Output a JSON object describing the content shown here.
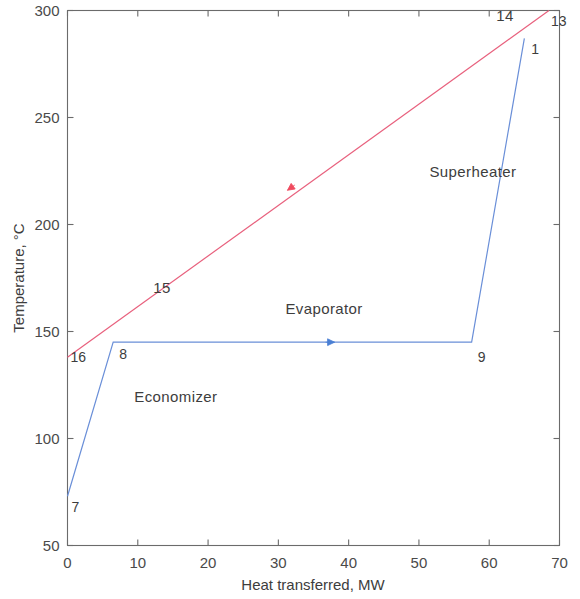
{
  "chart_data": {
    "type": "line",
    "title": "",
    "xlabel": "Heat transferred, MW",
    "ylabel": "Temperature, °C",
    "xlim": [
      0,
      70
    ],
    "ylim": [
      50,
      300
    ],
    "xticks": [
      "0",
      "10",
      "20",
      "30",
      "40",
      "50",
      "60",
      "70"
    ],
    "xtick_values": [
      0,
      10,
      20,
      30,
      40,
      50,
      60,
      70
    ],
    "yticks": [
      "50",
      "100",
      "150",
      "200",
      "250",
      "300"
    ],
    "ytick_values": [
      50,
      100,
      150,
      200,
      250,
      300
    ],
    "grid": false,
    "legend": "none",
    "series": [
      {
        "name": "Water / steam side",
        "color": "#6a8fd8",
        "direction": "left-to-right",
        "x": [
          0,
          6.5,
          57.5,
          65
        ],
        "y": [
          73,
          145,
          145,
          287
        ],
        "point_labels": [
          "7",
          "8",
          "9",
          "1"
        ]
      },
      {
        "name": "Flue gas side",
        "color": "#e8607d",
        "direction": "right-to-left",
        "x": [
          0,
          68.5
        ],
        "y": [
          138,
          300
        ],
        "point_labels": [
          "16",
          "13"
        ]
      }
    ],
    "annotations": [
      {
        "text": "Economizer",
        "x": 9.5,
        "y": 117
      },
      {
        "text": "Evaporator",
        "x": 31.0,
        "y": 158
      },
      {
        "text": "Superheater",
        "x": 51.5,
        "y": 222
      },
      {
        "text": "15",
        "x": 12.2,
        "y": 168
      },
      {
        "text": "14",
        "x": 61.0,
        "y": 295
      }
    ],
    "point_markers": [
      {
        "label": "7",
        "x": 0,
        "y": 73,
        "series": "Water / steam side"
      },
      {
        "label": "8",
        "x": 6.5,
        "y": 145,
        "series": "Water / steam side"
      },
      {
        "label": "9",
        "x": 57.5,
        "y": 145,
        "series": "Water / steam side"
      },
      {
        "label": "1",
        "x": 65,
        "y": 287,
        "series": "Water / steam side"
      },
      {
        "label": "16",
        "x": 0,
        "y": 138,
        "series": "Flue gas side"
      },
      {
        "label": "13",
        "x": 68.5,
        "y": 300,
        "series": "Flue gas side"
      }
    ],
    "colors": {
      "cold_stream": "#6a8fd8",
      "hot_stream": "#e8607d",
      "axis": "#6b6b6b",
      "text": "#3d3d3d",
      "background": "#ffffff"
    }
  }
}
